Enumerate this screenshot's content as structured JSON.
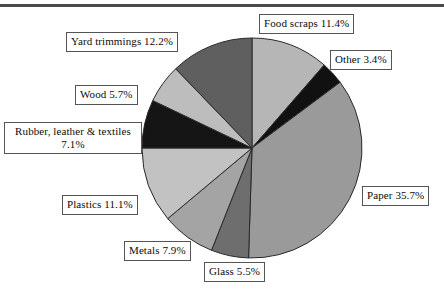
{
  "figure": {
    "has_top_rule": true,
    "background": "#ffffff"
  },
  "chart_data": {
    "type": "pie",
    "title": "",
    "xlabel": "",
    "ylabel": "",
    "legend_position": "callout-boxes",
    "grid": false,
    "total": 100.0,
    "units": "percent",
    "start_angle_deg": 0,
    "direction": "clockwise",
    "center": [
      252,
      148
    ],
    "radius": 110,
    "categories": [
      "Food scraps",
      "Other",
      "Paper",
      "Glass",
      "Metals",
      "Plastics",
      "Rubber, leather & textiles",
      "Wood",
      "Yard trimmings"
    ],
    "values": [
      11.4,
      3.4,
      35.7,
      5.5,
      7.9,
      11.1,
      7.1,
      5.7,
      12.2
    ],
    "colors": [
      "#b6b6b6",
      "#111111",
      "#9a9a9a",
      "#6e6e6e",
      "#a4a4a4",
      "#c2c2c2",
      "#151515",
      "#bdbdbd",
      "#5f5f5f"
    ],
    "slice_edge_color": "#2a2a2a",
    "labels": [
      "Food scraps 11.4%",
      "Other 3.4%",
      "Paper 35.7%",
      "Glass 5.5%",
      "Metals 7.9%",
      "Plastics 11.1%",
      "Rubber, leather & textiles 7.1%",
      "Wood 5.7%",
      "Yard trimmings 12.2%"
    ]
  },
  "callouts": {
    "food_scraps": "Food scraps 11.4%",
    "other": "Other 3.4%",
    "paper": "Paper 35.7%",
    "glass": "Glass 5.5%",
    "metals": "Metals 7.9%",
    "plastics": "Plastics 11.1%",
    "rubber_line1": "Rubber, leather & textiles",
    "rubber_line2": "7.1%",
    "wood": "Wood 5.7%",
    "yard_trimmings": "Yard trimmings 12.2%"
  }
}
